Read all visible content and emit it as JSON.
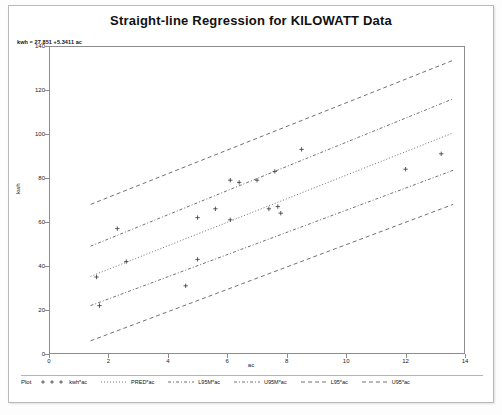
{
  "chart": {
    "title": "Straight-line Regression for KILOWATT Data",
    "equation": "kwh = 27.851 +5.3411 ac"
  },
  "legend": {
    "title": "Plot",
    "entries": [
      {
        "label": "kwh*ac",
        "style": "points"
      },
      {
        "label": "PRED*ac",
        "style": "dash-fine"
      },
      {
        "label": "L95M*ac",
        "style": "dash-dot"
      },
      {
        "label": "U95M*ac",
        "style": "dash-dot"
      },
      {
        "label": "L95*ac",
        "style": "dash-long"
      },
      {
        "label": "U95*ac",
        "style": "dash-long"
      }
    ]
  },
  "chart_data": {
    "type": "scatter",
    "title": "Straight-line Regression for KILOWATT Data",
    "xlabel": "ac",
    "ylabel": "kwh",
    "xlim": [
      0,
      14
    ],
    "ylim": [
      0,
      140
    ],
    "xticks": [
      0,
      2,
      4,
      6,
      8,
      10,
      12,
      14
    ],
    "yticks": [
      0,
      20,
      40,
      60,
      80,
      100,
      120,
      140
    ],
    "grid": false,
    "legend_position": "bottom",
    "annotations": [
      "kwh = 27.851 +5.3411 ac"
    ],
    "points": [
      {
        "x": 1.6,
        "y": 35
      },
      {
        "x": 1.7,
        "y": 22
      },
      {
        "x": 2.3,
        "y": 57
      },
      {
        "x": 2.6,
        "y": 42
      },
      {
        "x": 4.6,
        "y": 31
      },
      {
        "x": 5.0,
        "y": 62
      },
      {
        "x": 5.0,
        "y": 43
      },
      {
        "x": 5.6,
        "y": 66
      },
      {
        "x": 6.1,
        "y": 79
      },
      {
        "x": 6.1,
        "y": 61
      },
      {
        "x": 6.4,
        "y": 78
      },
      {
        "x": 7.0,
        "y": 79
      },
      {
        "x": 7.4,
        "y": 66
      },
      {
        "x": 7.6,
        "y": 83
      },
      {
        "x": 7.7,
        "y": 67
      },
      {
        "x": 7.8,
        "y": 64
      },
      {
        "x": 8.5,
        "y": 93
      },
      {
        "x": 12.0,
        "y": 84
      },
      {
        "x": 13.2,
        "y": 91
      }
    ],
    "series": [
      {
        "name": "PRED*ac",
        "style": "dash-fine",
        "endpoints": [
          {
            "x": 1.4,
            "y": 35.3
          },
          {
            "x": 13.6,
            "y": 100.5
          }
        ]
      },
      {
        "name": "L95M*ac",
        "style": "dash-dot",
        "endpoints": [
          {
            "x": 1.4,
            "y": 22.0
          },
          {
            "x": 13.6,
            "y": 83.5
          }
        ]
      },
      {
        "name": "U95M*ac",
        "style": "dash-dot",
        "endpoints": [
          {
            "x": 1.4,
            "y": 49.0
          },
          {
            "x": 13.6,
            "y": 116.0
          }
        ]
      },
      {
        "name": "L95*ac",
        "style": "dash-long",
        "endpoints": [
          {
            "x": 1.4,
            "y": 6.0
          },
          {
            "x": 13.6,
            "y": 68.0
          }
        ]
      },
      {
        "name": "U95*ac",
        "style": "dash-long",
        "endpoints": [
          {
            "x": 1.4,
            "y": 68.0
          },
          {
            "x": 13.6,
            "y": 133.5
          }
        ]
      }
    ]
  }
}
